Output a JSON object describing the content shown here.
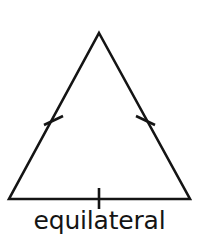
{
  "figure": {
    "name": "equilateral-triangle-diagram",
    "caption": "equilateral",
    "background_color": "#ffffff",
    "stroke_color": "#141414",
    "text_color": "#141414",
    "stroke_width": 2.6,
    "canvas": {
      "width": 199,
      "height": 239
    },
    "shape": {
      "type": "triangle",
      "classification": "equilateral",
      "vertices": [
        {
          "name": "apex",
          "x": 99,
          "y": 33
        },
        {
          "name": "bottom-right",
          "x": 190,
          "y": 199
        },
        {
          "name": "bottom-left",
          "x": 9,
          "y": 199
        }
      ],
      "points_attr": "99,33 190,199 9,199"
    },
    "tick_marks": [
      {
        "name": "left-side-congruence-tick",
        "side": "left",
        "x1": 44,
        "y1": 125,
        "x2": 63,
        "y2": 116
      },
      {
        "name": "right-side-congruence-tick",
        "side": "right",
        "x1": 136,
        "y1": 116,
        "x2": 155,
        "y2": 125
      },
      {
        "name": "base-congruence-tick",
        "side": "base",
        "x1": 99,
        "y1": 188,
        "x2": 99,
        "y2": 209
      }
    ]
  }
}
